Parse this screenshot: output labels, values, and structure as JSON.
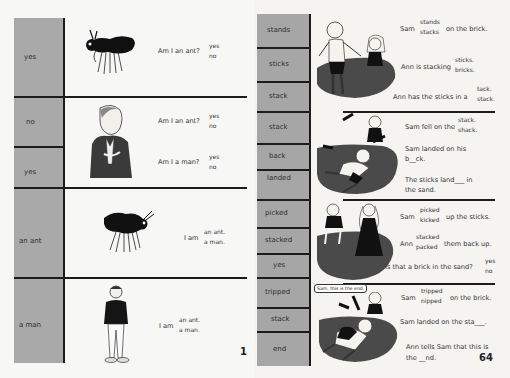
{
  "left_page": {
    "page_number": "1",
    "answers": [
      {
        "label": "yes"
      },
      {
        "label": "no"
      },
      {
        "label": "yes"
      },
      {
        "label": "an ant"
      },
      {
        "label": "a man"
      }
    ],
    "questions": [
      {
        "text": "Am I an ant?",
        "options": [
          "yes",
          "no"
        ]
      },
      {
        "text": "Am I an ant?",
        "options": [
          "yes",
          "no"
        ]
      },
      {
        "text": "Am I a man?",
        "options": [
          "yes",
          "no"
        ]
      },
      {
        "text": "I am",
        "options": [
          "an ant.",
          "a man."
        ]
      },
      {
        "text": "I am",
        "options": [
          "an ant.",
          "a man."
        ]
      }
    ],
    "illustrations": [
      "ant-illustration",
      "man-with-glasses-illustration",
      "ant-illustration",
      "standing-man-illustration"
    ]
  },
  "right_page": {
    "page_number": "64",
    "answers": [
      {
        "label": "stands"
      },
      {
        "label": "sticks"
      },
      {
        "label": "stack"
      },
      {
        "label": "stack"
      },
      {
        "label": "back"
      },
      {
        "label": "landed"
      },
      {
        "label": "picked"
      },
      {
        "label": "stacked"
      },
      {
        "label": "yes"
      },
      {
        "label": "tripped"
      },
      {
        "label": "stack"
      },
      {
        "label": "end"
      }
    ],
    "sections": [
      {
        "sentences": [
          {
            "before": "Sam",
            "options": [
              "stands",
              "stacks"
            ],
            "after": "on the brick."
          },
          {
            "before": "Ann is stacking",
            "options": [
              "sticks.",
              "bricks."
            ],
            "after": ""
          },
          {
            "before": "Ann has the sticks in a",
            "options": [
              "tack.",
              "stack."
            ],
            "after": ""
          }
        ]
      },
      {
        "sentences": [
          {
            "before": "Sam fell on the",
            "options": [
              "stack.",
              "shack."
            ],
            "after": ""
          },
          {
            "line1": "Sam landed on his",
            "line2": "b__ck."
          },
          {
            "line1": "The sticks land___  in",
            "line2": "the sand."
          }
        ]
      },
      {
        "sentences": [
          {
            "before": "Sam",
            "options": [
              "picked",
              "kicked"
            ],
            "after": "up the sticks."
          },
          {
            "before": "Ann",
            "options": [
              "stacked",
              "packed"
            ],
            "after": "them back up."
          },
          {
            "before": "Is that a brick in the sand?",
            "options": [
              "yes",
              "no"
            ],
            "after": ""
          }
        ]
      },
      {
        "speech_bubble": "Sam, this is the end.",
        "sentences": [
          {
            "before": "Sam",
            "options": [
              "tripped",
              "nipped"
            ],
            "after": "on the brick."
          },
          {
            "line1": "Sam landed on the sta___."
          },
          {
            "line1": "Ann tells Sam that this is",
            "line2": "the __nd."
          }
        ]
      }
    ]
  }
}
